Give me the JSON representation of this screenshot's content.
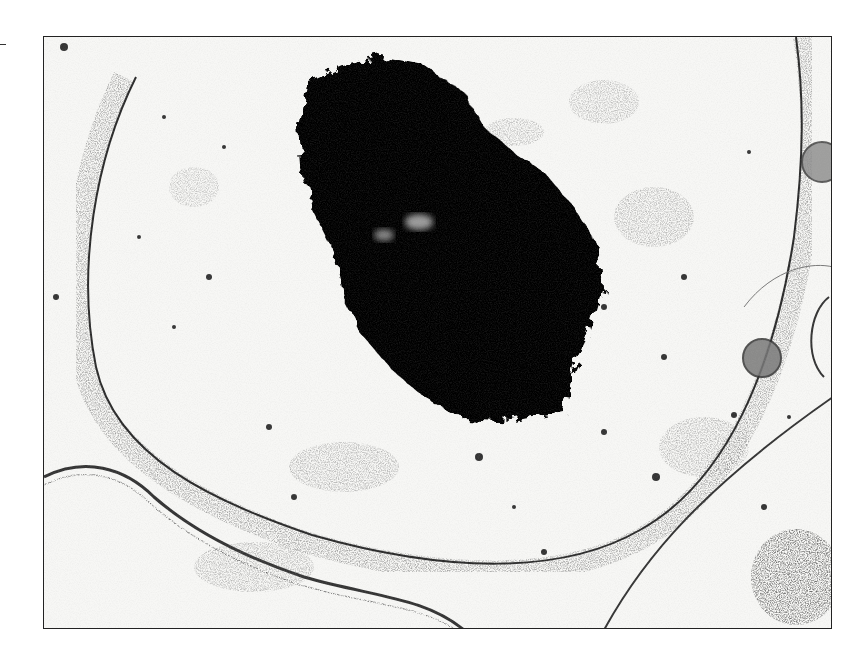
{
  "figure": {
    "type": "transmission electron micrograph",
    "features": [
      {
        "name": "nucleolus",
        "description": "large irregular electron-dense black mass, upper center"
      },
      {
        "name": "nucleus",
        "description": "large oval nucleus with peripheral heterochromatin"
      },
      {
        "name": "nuclear-envelope",
        "description": "double membrane boundary"
      },
      {
        "name": "mitochondria",
        "description": "small round organelles at right edge"
      },
      {
        "name": "adjacent-cells",
        "description": "neighbouring cells at lower left and lower right"
      }
    ],
    "colors": {
      "background": "#f7f7f5",
      "dense": "#000000",
      "chromatin": "#4a4a4a",
      "border": "#222222"
    }
  }
}
